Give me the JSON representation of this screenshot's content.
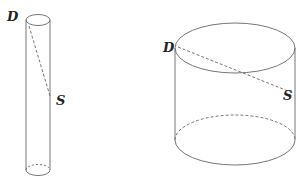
{
  "figures": [
    {
      "name": "tall-thin-cylinder",
      "labels": {
        "top_point": "D",
        "side_point": "S"
      }
    },
    {
      "name": "short-wide-cylinder",
      "labels": {
        "top_point": "D",
        "side_point": "S"
      }
    }
  ],
  "colors": {
    "stroke": "#555555",
    "text": "#222222"
  }
}
